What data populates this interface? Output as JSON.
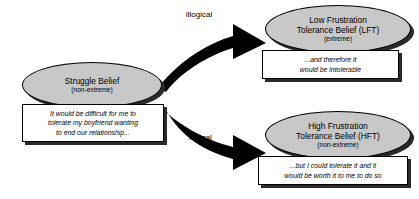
{
  "diagram": {
    "colors": {
      "node_fill": "#c8c8c8",
      "node_border": "#000000",
      "shadow": "#2b2b2b",
      "arrow": "#000000",
      "callout_fill": "#ffffff",
      "background": "#ffffff"
    },
    "nodes": [
      {
        "id": "struggle-belief",
        "title": "Struggle Belief",
        "subtitle": "(non-extreme)"
      },
      {
        "id": "lft",
        "title_line1": "Low Frustration",
        "title_line2": "Tolerance Belief (LFT)",
        "subtitle": "(extreme)"
      },
      {
        "id": "hft",
        "title_line1": "High Frustration",
        "title_line2": "Tolerance Belief (HFT)",
        "subtitle": "(non-extreme)"
      }
    ],
    "callouts": [
      {
        "id": "struggle-callout",
        "line1": "It would be difficult for me to",
        "line2": "tolerate my boyfriend wanting",
        "line3": "to end our relationship..."
      },
      {
        "id": "lft-callout",
        "line1": "...and therefore it",
        "line2": "would be intolerable"
      },
      {
        "id": "hft-callout",
        "line1": "...but I could tolerate it and it",
        "line2": "would be worth it to me to do so"
      }
    ],
    "arrows": [
      {
        "id": "arrow-illogical",
        "label": "illogical"
      },
      {
        "id": "arrow-logical",
        "label": "logical"
      }
    ]
  }
}
